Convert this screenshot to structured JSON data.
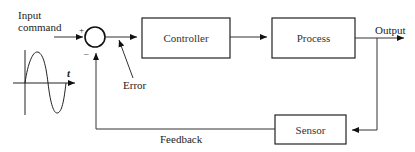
{
  "diagram": {
    "type": "feedback-control-loop",
    "input_label_line1": "Input",
    "input_label_line2": "command",
    "plus_sign": "+",
    "minus_sign": "–",
    "error_label": "Error",
    "signal_axis_label": "t",
    "blocks": {
      "controller": "Controller",
      "process": "Process",
      "sensor": "Sensor"
    },
    "output_label": "Output",
    "feedback_label": "Feedback"
  }
}
